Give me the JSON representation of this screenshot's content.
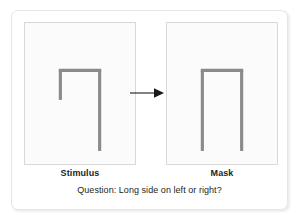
{
  "figure": {
    "panels": [
      {
        "id": "stimulus",
        "label": "Stimulus",
        "shape_name": "asymmetric-inverted-u",
        "description": "Inverted U with short left leg and long right leg"
      },
      {
        "id": "mask",
        "label": "Mask",
        "shape_name": "symmetric-inverted-u",
        "description": "Inverted U with both legs long"
      }
    ],
    "arrow": {
      "name": "rightward-arrow",
      "direction": "right"
    },
    "question": "Question: Long side on left or right?",
    "colors": {
      "stroke": "#8a8a8a",
      "panel_background": "#fbfbfb",
      "panel_border": "#d8d8d8",
      "card_border": "#e6e6e6",
      "text": "#231f20",
      "arrow": "#1a1a1a"
    }
  }
}
